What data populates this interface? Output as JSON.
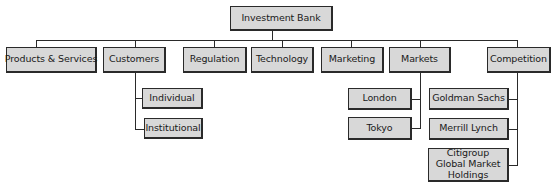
{
  "diagram": {
    "type": "org-chart",
    "root": {
      "label": "Investment Bank"
    },
    "departments": [
      {
        "label": "Products & Services",
        "children": []
      },
      {
        "label": "Customers",
        "children": [
          {
            "label": "Individual"
          },
          {
            "label": "Institutional"
          }
        ]
      },
      {
        "label": "Regulation",
        "children": []
      },
      {
        "label": "Technology",
        "children": []
      },
      {
        "label": "Marketing",
        "children": []
      },
      {
        "label": "Markets",
        "children": [
          {
            "label": "London"
          },
          {
            "label": "Tokyo"
          }
        ]
      },
      {
        "label": "Competition",
        "children": [
          {
            "label": "Goldman Sachs"
          },
          {
            "label": "Merrill Lynch"
          },
          {
            "label": "Citigroup Global Market Holdings"
          }
        ]
      }
    ]
  },
  "colors": {
    "box_fill": "#d8d8d8",
    "box_border": "#2a2a2a",
    "line": "#2a2a2a",
    "background": "#ffffff"
  }
}
